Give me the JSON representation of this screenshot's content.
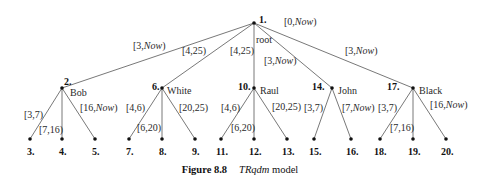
{
  "diagram": {
    "type": "tree",
    "nodes": [
      {
        "id": "1",
        "label": "1.",
        "name": "root",
        "x": 254,
        "y": 23
      },
      {
        "id": "2",
        "label": "2.",
        "name": "Bob",
        "x": 62,
        "y": 88
      },
      {
        "id": "6",
        "label": "6.",
        "name": "White",
        "x": 162,
        "y": 88
      },
      {
        "id": "10",
        "label": "10.",
        "name": "Raul",
        "x": 254,
        "y": 88
      },
      {
        "id": "14",
        "label": "14.",
        "name": "John",
        "x": 332,
        "y": 88
      },
      {
        "id": "17",
        "label": "17.",
        "name": "Black",
        "x": 413,
        "y": 88
      },
      {
        "id": "3",
        "label": "3.",
        "x": 30,
        "y": 139
      },
      {
        "id": "4",
        "label": "4.",
        "x": 62,
        "y": 139
      },
      {
        "id": "5",
        "label": "5.",
        "x": 95,
        "y": 139
      },
      {
        "id": "7",
        "label": "7.",
        "x": 129,
        "y": 139
      },
      {
        "id": "8",
        "label": "8.",
        "x": 162,
        "y": 139
      },
      {
        "id": "9",
        "label": "9.",
        "x": 195,
        "y": 139
      },
      {
        "id": "11",
        "label": "11.",
        "x": 221,
        "y": 139
      },
      {
        "id": "12",
        "label": "12.",
        "x": 254,
        "y": 139
      },
      {
        "id": "13",
        "label": "13.",
        "x": 287,
        "y": 139
      },
      {
        "id": "15",
        "label": "15.",
        "x": 314,
        "y": 139
      },
      {
        "id": "16",
        "label": "16.",
        "x": 351,
        "y": 139
      },
      {
        "id": "18",
        "label": "18.",
        "x": 380,
        "y": 139
      },
      {
        "id": "19",
        "label": "19.",
        "x": 413,
        "y": 139
      },
      {
        "id": "20",
        "label": "20.",
        "x": 446,
        "y": 139
      }
    ],
    "root_interval": {
      "start": "[0,",
      "end": "Now",
      "close": ")"
    },
    "edges": [
      {
        "from": "1",
        "to": "2",
        "start": "[3,",
        "end": "Now",
        "close": ")"
      },
      {
        "from": "1",
        "to": "6",
        "start": "[4,25)",
        "end": "",
        "close": ""
      },
      {
        "from": "1",
        "to": "10",
        "start": "[4,25)",
        "end": "",
        "close": ""
      },
      {
        "from": "1",
        "to": "14",
        "start": "[3,",
        "end": "Now",
        "close": ")"
      },
      {
        "from": "1",
        "to": "17",
        "start": "[3,",
        "end": "Now",
        "close": ")"
      },
      {
        "from": "2",
        "to": "3",
        "start": "[3,7)",
        "end": "",
        "close": ""
      },
      {
        "from": "2",
        "to": "4",
        "start": "[7,16)",
        "end": "",
        "close": ""
      },
      {
        "from": "2",
        "to": "5",
        "start": "[16,",
        "end": "Now",
        "close": ")"
      },
      {
        "from": "6",
        "to": "7",
        "start": "[4,6)",
        "end": "",
        "close": ""
      },
      {
        "from": "6",
        "to": "8",
        "start": "[6,20)",
        "end": "",
        "close": ""
      },
      {
        "from": "6",
        "to": "9",
        "start": "[20,25)",
        "end": "",
        "close": ""
      },
      {
        "from": "10",
        "to": "11",
        "start": "[4,6)",
        "end": "",
        "close": ""
      },
      {
        "from": "10",
        "to": "12",
        "start": "[6,20)",
        "end": "",
        "close": ""
      },
      {
        "from": "10",
        "to": "13",
        "start": "[20,25)",
        "end": "",
        "close": ""
      },
      {
        "from": "14",
        "to": "15",
        "start": "[3,7)",
        "end": "",
        "close": ""
      },
      {
        "from": "14",
        "to": "16",
        "start": "[7,",
        "end": "Now",
        "close": ")"
      },
      {
        "from": "17",
        "to": "18",
        "start": "[3,7)",
        "end": "",
        "close": ""
      },
      {
        "from": "17",
        "to": "19",
        "start": "[7,16)",
        "end": "",
        "close": ""
      },
      {
        "from": "17",
        "to": "20",
        "start": "[16,",
        "end": "Now",
        "close": ")"
      }
    ]
  },
  "caption": {
    "figure": "Figure 8.8",
    "title": "TRqdm",
    "suffix": "model"
  }
}
